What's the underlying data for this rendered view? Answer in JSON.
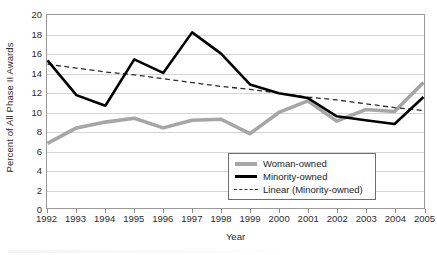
{
  "chart_data": {
    "type": "line",
    "title": "",
    "xlabel": "Year",
    "ylabel": "Percent of All Phase II Awards",
    "categories": [
      "1992",
      "1993",
      "1994",
      "1995",
      "1996",
      "1997",
      "1998",
      "1999",
      "2000",
      "2001",
      "2002",
      "2003",
      "2004",
      "2005"
    ],
    "x": [
      1992,
      1993,
      1994,
      1995,
      1996,
      1997,
      1998,
      1999,
      2000,
      2001,
      2002,
      2003,
      2004,
      2005
    ],
    "ylim": [
      0,
      20
    ],
    "xlim": [
      1992,
      2005
    ],
    "yticks": [
      0,
      2,
      4,
      6,
      8,
      10,
      12,
      14,
      16,
      18,
      20
    ],
    "grid": true,
    "legend_position": "inside-bottom-right",
    "series": [
      {
        "name": "Woman-owned",
        "style": "solid",
        "color": "#a6a6a6",
        "width": 3.6,
        "values": [
          6.7,
          8.3,
          8.9,
          9.3,
          8.3,
          9.1,
          9.2,
          7.7,
          9.9,
          11.1,
          9.0,
          10.2,
          10.0,
          13.0
        ]
      },
      {
        "name": "Minority-owned",
        "style": "solid",
        "color": "#000000",
        "width": 2.6,
        "values": [
          15.3,
          11.7,
          10.6,
          15.4,
          14.0,
          18.2,
          16.0,
          12.8,
          11.9,
          11.4,
          9.5,
          9.1,
          8.7,
          11.5
        ]
      },
      {
        "name": "Linear (Minority-owned)",
        "style": "dashed",
        "color": "#2a2a2a",
        "width": 1.3,
        "values": [
          14.9,
          14.5,
          14.1,
          13.8,
          13.4,
          13.0,
          12.6,
          12.3,
          11.9,
          11.5,
          11.2,
          10.8,
          10.4,
          10.1
        ]
      }
    ]
  },
  "axes": {
    "y_title": "Percent of All Phase II Awards",
    "x_title": "Year",
    "y_tick_labels": [
      "20",
      "18",
      "16",
      "14",
      "12",
      "10",
      "8",
      "6",
      "4",
      "2",
      "0"
    ],
    "x_tick_labels": [
      "1992",
      "1993",
      "1994",
      "1995",
      "1996",
      "1997",
      "1998",
      "1999",
      "2000",
      "2001",
      "2002",
      "2003",
      "2004",
      "2005"
    ]
  },
  "legend": {
    "items": [
      {
        "label": "Woman-owned",
        "key": "solid-thick-gray-line-swatch"
      },
      {
        "label": "Minority-owned",
        "key": "solid-black-line-swatch"
      },
      {
        "label": "Linear (Minority-owned)",
        "key": "dashed-black-line-swatch"
      }
    ]
  },
  "colors": {
    "woman_owned": "#a6a6a6",
    "minority_owned": "#000000",
    "trendline": "#2a2a2a",
    "gridline": "#d4d4d4",
    "axis": "#9a9a9a",
    "text": "#2b2b2b",
    "background": "#ffffff"
  }
}
